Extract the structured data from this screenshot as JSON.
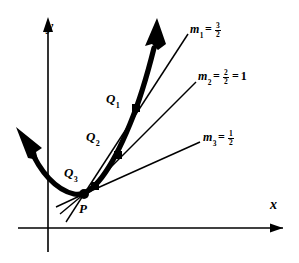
{
  "figure": {
    "background_color": "#ffffff",
    "ink_color": "#000000"
  },
  "axes": {
    "x_label": "x",
    "y_label": "y",
    "x_axis_name": "x-axis",
    "y_axis_name": "y-axis",
    "origin": {
      "x": 48,
      "y": 228
    }
  },
  "points": [
    {
      "id": "P",
      "label": "P",
      "x": 85,
      "y": 193
    },
    {
      "id": "Q1",
      "label": "Q",
      "sub": "1",
      "x": 136,
      "y": 108
    },
    {
      "id": "Q2",
      "label": "Q",
      "sub": "2",
      "x": 118,
      "y": 155
    },
    {
      "id": "Q3",
      "label": "Q",
      "sub": "3",
      "x": 95,
      "y": 186
    }
  ],
  "slopes": [
    {
      "id": "m1",
      "name": "m",
      "sub": "1",
      "equals": "=",
      "value_numerator": "3",
      "value_denominator": "2",
      "extra_equals": "",
      "extra_value": ""
    },
    {
      "id": "m2",
      "name": "m",
      "sub": "2",
      "equals": "=",
      "value_numerator": "2",
      "value_denominator": "2",
      "extra_equals": "=",
      "extra_value": "1"
    },
    {
      "id": "m3",
      "name": "m",
      "sub": "3",
      "equals": "=",
      "value_numerator": "1",
      "value_denominator": "2",
      "extra_equals": "",
      "extra_value": ""
    }
  ],
  "curve": {
    "name": "parabola",
    "stroke_width": 5,
    "has_upper_arrow": true,
    "has_lower_arrow": true
  },
  "secant_lines": [
    {
      "id": "secant-1",
      "through": "Q1"
    },
    {
      "id": "secant-2",
      "through": "Q2"
    },
    {
      "id": "secant-3",
      "through": "Q3"
    }
  ]
}
